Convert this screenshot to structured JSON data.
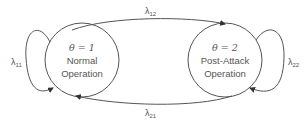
{
  "diagram": {
    "type": "state-transition",
    "colors": {
      "stroke": "#555555",
      "text": "#555555",
      "background": "#ffffff"
    },
    "states": [
      {
        "id": "s1",
        "theta_label": "θ = 1",
        "name_line1": "Normal",
        "name_line2": "Operation"
      },
      {
        "id": "s2",
        "theta_label": "θ = 2",
        "name_line1": "Post-Attack",
        "name_line2": "Operation"
      }
    ],
    "transitions": [
      {
        "from": "s1",
        "to": "s1",
        "symbol": "λ",
        "subscript": "11"
      },
      {
        "from": "s1",
        "to": "s2",
        "symbol": "λ",
        "subscript": "12"
      },
      {
        "from": "s2",
        "to": "s1",
        "symbol": "λ",
        "subscript": "21"
      },
      {
        "from": "s2",
        "to": "s2",
        "symbol": "λ",
        "subscript": "22"
      }
    ]
  }
}
